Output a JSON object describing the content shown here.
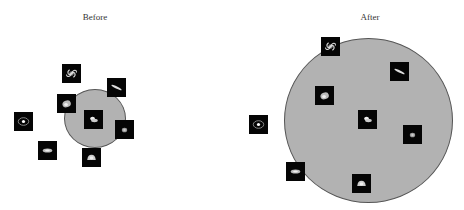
{
  "panels": [
    {
      "title": "Before",
      "title_x": 95,
      "circle": {
        "cx": 94.5,
        "cy": 118,
        "rx": 31,
        "ry": 29.5
      },
      "galaxies": [
        {
          "type": "spiral",
          "x": 62,
          "y": 64
        },
        {
          "type": "edge-on",
          "x": 107,
          "y": 78
        },
        {
          "type": "elliptical-blob",
          "x": 57,
          "y": 94
        },
        {
          "type": "irregular",
          "x": 84,
          "y": 110
        },
        {
          "type": "ring",
          "x": 14,
          "y": 112
        },
        {
          "type": "elliptical-small",
          "x": 115,
          "y": 120
        },
        {
          "type": "elongated-elliptical",
          "x": 38,
          "y": 141
        },
        {
          "type": "lenticular",
          "x": 82,
          "y": 148
        }
      ]
    },
    {
      "title": "After",
      "title_x": 370,
      "circle": {
        "cx": 368.5,
        "cy": 120.5,
        "rx": 84.5,
        "ry": 82.5
      },
      "galaxies": [
        {
          "type": "spiral",
          "x": 321,
          "y": 37
        },
        {
          "type": "edge-on",
          "x": 390,
          "y": 62
        },
        {
          "type": "elliptical-blob",
          "x": 315,
          "y": 86
        },
        {
          "type": "irregular",
          "x": 358,
          "y": 110
        },
        {
          "type": "ring",
          "x": 249,
          "y": 115
        },
        {
          "type": "elliptical-small",
          "x": 403,
          "y": 125
        },
        {
          "type": "elongated-elliptical",
          "x": 286,
          "y": 162
        },
        {
          "type": "lenticular",
          "x": 352,
          "y": 174
        }
      ]
    }
  ],
  "colors": {
    "circle_fill": "#b2b2b2",
    "circle_stroke": "#555555",
    "thumb_bg": "#050505"
  }
}
